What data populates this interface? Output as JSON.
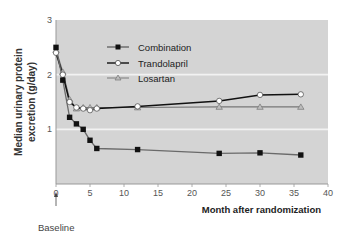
{
  "chart_data": {
    "type": "line",
    "title": "",
    "xlabel": "Month after randomization",
    "ylabel": "Median urinary protein excretion (g/day)",
    "xlim": [
      0,
      40
    ],
    "ylim": [
      0,
      3
    ],
    "xticks": [
      0,
      5,
      10,
      15,
      20,
      25,
      30,
      35,
      40
    ],
    "yticks": [
      1,
      2,
      3
    ],
    "grid": "horizontal white lines at 1, 2",
    "legend_position": "upper center inside plot",
    "annotation": "Baseline",
    "series": [
      {
        "name": "Combination",
        "marker": "filled-square",
        "color": "#222222",
        "x": [
          0,
          1,
          2,
          3,
          4,
          5,
          6,
          12,
          24,
          30,
          36
        ],
        "y": [
          2.5,
          1.9,
          1.22,
          1.1,
          1.0,
          0.8,
          0.65,
          0.63,
          0.56,
          0.57,
          0.53
        ]
      },
      {
        "name": "Trandolapril",
        "marker": "open-circle",
        "color": "#111111",
        "x": [
          0,
          1,
          2,
          3,
          4,
          5,
          6,
          12,
          24,
          30,
          36
        ],
        "y": [
          2.4,
          2.0,
          1.5,
          1.4,
          1.38,
          1.35,
          1.38,
          1.42,
          1.52,
          1.63,
          1.64
        ]
      },
      {
        "name": "Losartan",
        "marker": "open-triangle",
        "color": "#777777",
        "x": [
          0,
          1,
          2,
          3,
          4,
          5,
          6,
          12,
          24,
          30,
          36
        ],
        "y": [
          2.45,
          2.05,
          1.55,
          1.38,
          1.4,
          1.4,
          1.4,
          1.4,
          1.41,
          1.41,
          1.41
        ]
      }
    ]
  },
  "labels": {
    "ylabel_line1": "Median urinary protein",
    "ylabel_line2": "excretion (g/day)",
    "xlabel": "Month after randomization",
    "baseline": "Baseline",
    "legend": [
      "Combination",
      "Trandolapril",
      "Losartan"
    ],
    "xticks": [
      "0",
      "5",
      "10",
      "15",
      "20",
      "25",
      "30",
      "35",
      "40"
    ],
    "yticks": [
      "3",
      "2",
      "1"
    ]
  }
}
